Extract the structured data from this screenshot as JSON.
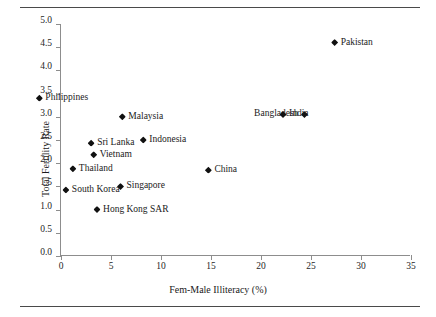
{
  "chart_data": {
    "type": "scatter",
    "title": "",
    "xlabel": "Fem-Male Illiteracy (%)",
    "ylabel": "Total Fertility Rate",
    "xlim": [
      0,
      35
    ],
    "ylim": [
      0.0,
      5.0
    ],
    "xticks": [
      0,
      5,
      10,
      15,
      20,
      25,
      30,
      35
    ],
    "xtick_labels": [
      "0",
      "5",
      "10",
      "15",
      "20",
      "25",
      "30",
      "35"
    ],
    "yticks": [
      0.0,
      0.5,
      1.0,
      1.5,
      2.0,
      2.5,
      3.0,
      3.5,
      4.0,
      4.5,
      5.0
    ],
    "ytick_labels": [
      "0.0",
      "0.5",
      "1.0",
      "1.5",
      "2.0",
      "2.5",
      "3.0",
      "3.5",
      "4.0",
      "4.5",
      "5.0"
    ],
    "grid": false,
    "legend": false,
    "marker_color": "#111111",
    "points": [
      {
        "label": "Philippines",
        "x": 0.1,
        "y": 3.4,
        "label_side": "right"
      },
      {
        "label": "Pakistan",
        "x": 29.1,
        "y": 4.6,
        "label_side": "right"
      },
      {
        "label": "Malaysia",
        "x": 8.0,
        "y": 3.0,
        "label_side": "right"
      },
      {
        "label": "Bangladesh",
        "x": 22.0,
        "y": 3.05,
        "label_side": "left"
      },
      {
        "label": "India",
        "x": 23.3,
        "y": 3.05,
        "label_side": "right"
      },
      {
        "label": "Indonesia",
        "x": 10.2,
        "y": 2.5,
        "label_side": "right"
      },
      {
        "label": "Sri Lanka",
        "x": 5.0,
        "y": 2.43,
        "label_side": "right"
      },
      {
        "label": "Vietnam",
        "x": 5.0,
        "y": 2.18,
        "label_side": "right"
      },
      {
        "label": "Thailand",
        "x": 3.0,
        "y": 1.88,
        "label_side": "right"
      },
      {
        "label": "China",
        "x": 16.0,
        "y": 1.85,
        "label_side": "right"
      },
      {
        "label": "Singapore",
        "x": 8.0,
        "y": 1.5,
        "label_side": "right"
      },
      {
        "label": "South Korea",
        "x": 3.0,
        "y": 1.42,
        "label_side": "right"
      },
      {
        "label": "Hong Kong SAR",
        "x": 7.0,
        "y": 1.0,
        "label_side": "right"
      }
    ]
  }
}
